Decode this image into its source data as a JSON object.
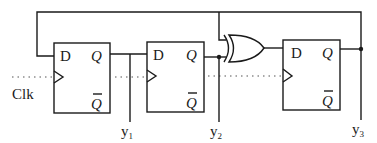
{
  "diagram": {
    "type": "sequential-logic-circuit",
    "clock_label": "Clk",
    "flip_flops": [
      {
        "id": "ff1",
        "type": "D",
        "input_label": "D",
        "q_label": "Q",
        "qbar_label": "Q"
      },
      {
        "id": "ff2",
        "type": "D",
        "input_label": "D",
        "q_label": "Q",
        "qbar_label": "Q"
      },
      {
        "id": "ff3",
        "type": "D",
        "input_label": "D",
        "q_label": "Q",
        "qbar_label": "Q"
      }
    ],
    "gates": [
      {
        "id": "xor1",
        "type": "XOR",
        "inputs": [
          "y3 (feedback)",
          "y2"
        ],
        "output": "ff3.D"
      }
    ],
    "outputs": [
      {
        "label": "y",
        "subscript": "1",
        "source": "ff1.Q"
      },
      {
        "label": "y",
        "subscript": "2",
        "source": "ff2.Q"
      },
      {
        "label": "y",
        "subscript": "3",
        "source": "ff3.Q"
      }
    ],
    "connections": [
      "ff3.Q -> top feedback wire -> ff1.D",
      "ff3.Q -> xor1.input1",
      "ff1.Q -> ff2.D",
      "ff2.Q -> xor1.input2",
      "xor1.out -> ff3.D",
      "Clk -> ff1.clk, ff2.clk, ff3.clk"
    ],
    "colors": {
      "line": "#1a1a1a",
      "background": "#ffffff",
      "clock_line": "#555555"
    }
  }
}
